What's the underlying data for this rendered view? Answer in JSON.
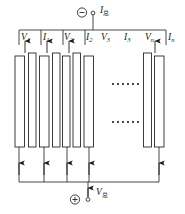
{
  "figure": {
    "type": "electrical-circuit-diagram",
    "ellipsis_glyph": "······"
  },
  "colors": {
    "stroke": "#1b1b1b",
    "plate_fill": "#ffffff",
    "background": "#ffffff",
    "text": "#1b1b1b"
  },
  "terminals": {
    "negative": {
      "symbol": "⊖",
      "polarity_glyph": "−",
      "label_text": "I",
      "label_sub": "总",
      "node_marker": "○"
    },
    "positive": {
      "symbol": "⊕",
      "polarity_glyph": "+",
      "label_text": "V",
      "label_sub": "总",
      "node_marker": "○"
    }
  },
  "top_labels": [
    {
      "text": "V",
      "sub": "1"
    },
    {
      "text": "I",
      "sub": "1"
    },
    {
      "text": "V",
      "sub": "2"
    },
    {
      "text": "I",
      "sub": "2"
    },
    {
      "text": "V",
      "sub": "3"
    },
    {
      "text": "I",
      "sub": "3"
    },
    {
      "text": "V",
      "sub": "n"
    },
    {
      "text": "I",
      "sub": "n"
    }
  ],
  "plates": {
    "left_group_count": 7,
    "right_group_count": 2,
    "total_label": "n"
  },
  "arrows": {
    "top_count": 4,
    "bottom_count": 5
  }
}
